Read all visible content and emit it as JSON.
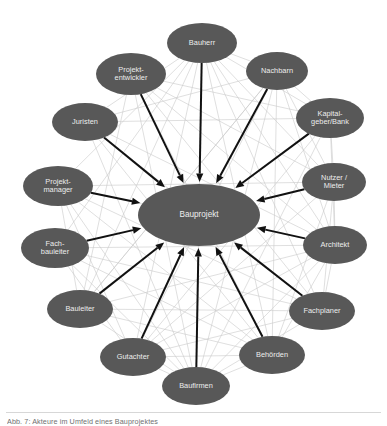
{
  "figure": {
    "title": "Akteure im Umfeld eines Bauprojektes",
    "caption": "Abb. 7: Akteure im Umfeld eines Bauprojektes",
    "colors": {
      "node_fill": "#585858",
      "node_text": "#ededed",
      "arrow": "#111111",
      "web_line": "#c9c9c9",
      "background": "#ffffff",
      "caption_text": "#6f6f6f",
      "rule": "#d7d7d7"
    }
  },
  "chart_data": {
    "type": "diagram",
    "layout": "hub-and-spoke radial network",
    "title": "Akteure im Umfeld eines Bauprojektes",
    "hub": {
      "id": "bauprojekt",
      "label": "Bauprojekt",
      "cx": 199,
      "cy": 215,
      "rx": 61,
      "ry": 31
    },
    "nodes": [
      {
        "id": "bauherr",
        "label": "Bauherr",
        "lines": [
          "Bauherr"
        ],
        "cx": 202,
        "cy": 43,
        "rx": 35,
        "ry": 20,
        "angle_deg": 268
      },
      {
        "id": "nachbarn",
        "label": "Nachbarn",
        "lines": [
          "Nachbarn"
        ],
        "cx": 277,
        "cy": 71,
        "rx": 31,
        "ry": 19,
        "angle_deg": 298
      },
      {
        "id": "kapitalgeber",
        "label": "Kapital-geber/Bank",
        "lines": [
          "Kapital-",
          "geber/Bank"
        ],
        "cx": 330,
        "cy": 118,
        "rx": 34,
        "ry": 20,
        "angle_deg": 322
      },
      {
        "id": "nutzer_mieter",
        "label": "Nutzer / Mieter",
        "lines": [
          "Nutzer /",
          "Mieter"
        ],
        "cx": 334,
        "cy": 182,
        "rx": 32,
        "ry": 19,
        "angle_deg": 352
      },
      {
        "id": "architekt",
        "label": "Architekt",
        "lines": [
          "Architekt"
        ],
        "cx": 335,
        "cy": 245,
        "rx": 32,
        "ry": 19,
        "angle_deg": 25
      },
      {
        "id": "fachplaner",
        "label": "Fachplaner",
        "lines": [
          "Fachplaner"
        ],
        "cx": 322,
        "cy": 311,
        "rx": 33,
        "ry": 19,
        "angle_deg": 52
      },
      {
        "id": "behoerden",
        "label": "Behörden",
        "lines": [
          "Behörden"
        ],
        "cx": 272,
        "cy": 355,
        "rx": 33,
        "ry": 19,
        "angle_deg": 78
      },
      {
        "id": "baufirmen",
        "label": "Baufirmen",
        "lines": [
          "Baufirmen"
        ],
        "cx": 196,
        "cy": 386,
        "rx": 34,
        "ry": 19,
        "angle_deg": 100
      },
      {
        "id": "gutachter",
        "label": "Gutachter",
        "lines": [
          "Gutachter"
        ],
        "cx": 133,
        "cy": 357,
        "rx": 33,
        "ry": 19,
        "angle_deg": 122
      },
      {
        "id": "bauleiter",
        "label": "Bauleiter",
        "lines": [
          "Bauleiter"
        ],
        "cx": 80,
        "cy": 309,
        "rx": 33,
        "ry": 19,
        "angle_deg": 148
      },
      {
        "id": "fachbauleiter",
        "label": "Fach-bauleiter",
        "lines": [
          "Fach-",
          "bauleiter"
        ],
        "cx": 55,
        "cy": 248,
        "rx": 34,
        "ry": 20,
        "angle_deg": 175
      },
      {
        "id": "projektmanager",
        "label": "Projekt-manager",
        "lines": [
          "Projekt-",
          "manager"
        ],
        "cx": 58,
        "cy": 186,
        "rx": 35,
        "ry": 20,
        "angle_deg": 200
      },
      {
        "id": "juristen",
        "label": "Juristen",
        "lines": [
          "Juristen"
        ],
        "cx": 85,
        "cy": 122,
        "rx": 33,
        "ry": 19,
        "angle_deg": 225
      },
      {
        "id": "projektentwickler",
        "label": "Projekt-entwickler",
        "lines": [
          "Projekt-",
          "entwickler"
        ],
        "cx": 131,
        "cy": 74,
        "rx": 35,
        "ry": 21,
        "angle_deg": 247
      }
    ],
    "arrows": [
      {
        "from": "bauherr",
        "to": "bauprojekt",
        "style": "thick-black",
        "direction": "in"
      },
      {
        "from": "nachbarn",
        "to": "bauprojekt",
        "style": "thick-black",
        "direction": "in"
      },
      {
        "from": "kapitalgeber",
        "to": "bauprojekt",
        "style": "thick-black",
        "direction": "in"
      },
      {
        "from": "nutzer_mieter",
        "to": "bauprojekt",
        "style": "thick-black",
        "direction": "in"
      },
      {
        "from": "architekt",
        "to": "bauprojekt",
        "style": "thick-black",
        "direction": "in"
      },
      {
        "from": "fachplaner",
        "to": "bauprojekt",
        "style": "thick-black",
        "direction": "in"
      },
      {
        "from": "behoerden",
        "to": "bauprojekt",
        "style": "thick-black",
        "direction": "in"
      },
      {
        "from": "baufirmen",
        "to": "bauprojekt",
        "style": "thick-black",
        "direction": "in"
      },
      {
        "from": "gutachter",
        "to": "bauprojekt",
        "style": "thick-black",
        "direction": "in"
      },
      {
        "from": "bauleiter",
        "to": "bauprojekt",
        "style": "thick-black",
        "direction": "in"
      },
      {
        "from": "fachbauleiter",
        "to": "bauprojekt",
        "style": "thick-black",
        "direction": "in"
      },
      {
        "from": "projektmanager",
        "to": "bauprojekt",
        "style": "thick-black",
        "direction": "in"
      },
      {
        "from": "juristen",
        "to": "bauprojekt",
        "style": "thick-black",
        "direction": "in"
      },
      {
        "from": "projektentwickler",
        "to": "bauprojekt",
        "style": "thick-black",
        "direction": "in"
      }
    ],
    "web_links": [
      [
        "bauherr",
        "juristen"
      ],
      [
        "bauherr",
        "projektmanager"
      ],
      [
        "bauherr",
        "fachbauleiter"
      ],
      [
        "bauherr",
        "bauleiter"
      ],
      [
        "bauherr",
        "gutachter"
      ],
      [
        "bauherr",
        "behoerden"
      ],
      [
        "bauherr",
        "fachplaner"
      ],
      [
        "bauherr",
        "architekt"
      ],
      [
        "bauherr",
        "nutzer_mieter"
      ],
      [
        "bauherr",
        "kapitalgeber"
      ],
      [
        "bauherr",
        "nachbarn"
      ],
      [
        "bauherr",
        "baufirmen"
      ],
      [
        "projektentwickler",
        "kapitalgeber"
      ],
      [
        "projektentwickler",
        "architekt"
      ],
      [
        "projektentwickler",
        "behoerden"
      ],
      [
        "projektentwickler",
        "nutzer_mieter"
      ],
      [
        "projektentwickler",
        "baufirmen"
      ],
      [
        "projektentwickler",
        "fachplaner"
      ],
      [
        "juristen",
        "behoerden"
      ],
      [
        "juristen",
        "kapitalgeber"
      ],
      [
        "juristen",
        "nachbarn"
      ],
      [
        "juristen",
        "baufirmen"
      ],
      [
        "juristen",
        "architekt"
      ],
      [
        "projektmanager",
        "architekt"
      ],
      [
        "projektmanager",
        "fachplaner"
      ],
      [
        "projektmanager",
        "baufirmen"
      ],
      [
        "projektmanager",
        "behoerden"
      ],
      [
        "projektmanager",
        "gutachter"
      ],
      [
        "projektmanager",
        "bauleiter"
      ],
      [
        "fachbauleiter",
        "baufirmen"
      ],
      [
        "fachbauleiter",
        "fachplaner"
      ],
      [
        "fachbauleiter",
        "architekt"
      ],
      [
        "fachbauleiter",
        "behoerden"
      ],
      [
        "bauleiter",
        "baufirmen"
      ],
      [
        "bauleiter",
        "architekt"
      ],
      [
        "bauleiter",
        "fachplaner"
      ],
      [
        "bauleiter",
        "behoerden"
      ],
      [
        "bauleiter",
        "nachbarn"
      ],
      [
        "gutachter",
        "behoerden"
      ],
      [
        "gutachter",
        "architekt"
      ],
      [
        "gutachter",
        "fachplaner"
      ],
      [
        "gutachter",
        "nutzer_mieter"
      ],
      [
        "gutachter",
        "baufirmen"
      ],
      [
        "baufirmen",
        "architekt"
      ],
      [
        "baufirmen",
        "fachplaner"
      ],
      [
        "baufirmen",
        "behoerden"
      ],
      [
        "baufirmen",
        "nachbarn"
      ],
      [
        "baufirmen",
        "kapitalgeber"
      ],
      [
        "behoerden",
        "architekt"
      ],
      [
        "behoerden",
        "nachbarn"
      ],
      [
        "behoerden",
        "nutzer_mieter"
      ],
      [
        "fachplaner",
        "architekt"
      ],
      [
        "fachplaner",
        "nutzer_mieter"
      ],
      [
        "architekt",
        "nutzer_mieter"
      ],
      [
        "architekt",
        "kapitalgeber"
      ],
      [
        "architekt",
        "nachbarn"
      ],
      [
        "nutzer_mieter",
        "kapitalgeber"
      ],
      [
        "nutzer_mieter",
        "nachbarn"
      ],
      [
        "kapitalgeber",
        "nachbarn"
      ],
      [
        "kapitalgeber",
        "gutachter"
      ],
      [
        "nachbarn",
        "gutachter"
      ],
      [
        "nachbarn",
        "bauleiter"
      ],
      [
        "juristen",
        "fachplaner"
      ],
      [
        "projektentwickler",
        "bauleiter"
      ],
      [
        "projektmanager",
        "nutzer_mieter"
      ],
      [
        "fachbauleiter",
        "gutachter"
      ]
    ]
  }
}
